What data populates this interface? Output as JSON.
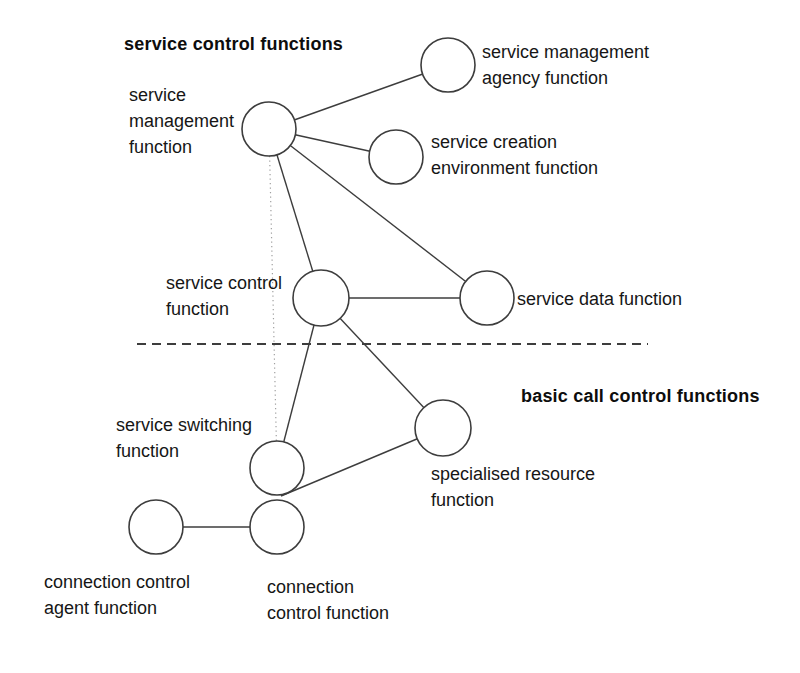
{
  "headings": {
    "service_control": "service control functions",
    "basic_call_control": "basic call control functions"
  },
  "nodes": {
    "smf": {
      "lines": [
        "service",
        "management",
        "function"
      ]
    },
    "smaf": {
      "lines": [
        "service management",
        "agency function"
      ]
    },
    "scef": {
      "lines": [
        "service creation",
        "environment function"
      ]
    },
    "scf": {
      "lines": [
        "service control",
        "function"
      ]
    },
    "sdf": {
      "lines": [
        "service data function"
      ]
    },
    "ssf": {
      "lines": [
        "service switching",
        "function"
      ]
    },
    "srf": {
      "lines": [
        "specialised resource",
        "function"
      ]
    },
    "ccaf": {
      "lines": [
        "connection control",
        "agent function"
      ]
    },
    "ccf": {
      "lines": [
        "connection",
        "control function"
      ]
    }
  },
  "edges": [
    {
      "from": "smf",
      "to": "smaf"
    },
    {
      "from": "smf",
      "to": "scef"
    },
    {
      "from": "smf",
      "to": "sdf"
    },
    {
      "from": "smf",
      "to": "scf"
    },
    {
      "from": "smf",
      "to": "ssf",
      "style": "dotted"
    },
    {
      "from": "scf",
      "to": "sdf"
    },
    {
      "from": "scf",
      "to": "ssf"
    },
    {
      "from": "scf",
      "to": "srf"
    },
    {
      "from": "srf",
      "to": "ssf_ccf_junction"
    },
    {
      "from": "ccaf",
      "to": "ccf"
    }
  ],
  "colors": {
    "background": "#ffffff",
    "line": "#3d3d3d",
    "dotted_line": "#a0a0a0",
    "dashed_divider": "#3d3d3d",
    "text": "#161616"
  }
}
